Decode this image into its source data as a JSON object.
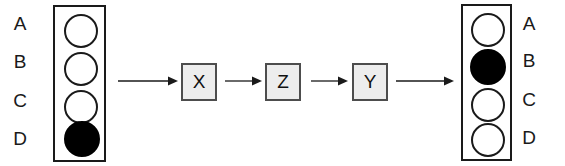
{
  "diagram": {
    "colors": {
      "stroke": "#1a1a1a",
      "filled": "#000000",
      "empty": "#ffffff",
      "box_fill": "#ededed",
      "box_border": "#4d4d4d",
      "background": "#ffffff"
    },
    "input_register": {
      "name": "input-register",
      "labels_side": "left",
      "rows": [
        {
          "label": "A",
          "state": "empty"
        },
        {
          "label": "B",
          "state": "empty"
        },
        {
          "label": "C",
          "state": "empty"
        },
        {
          "label": "D",
          "state": "filled"
        }
      ]
    },
    "output_register": {
      "name": "output-register",
      "labels_side": "right",
      "rows": [
        {
          "label": "A",
          "state": "empty"
        },
        {
          "label": "B",
          "state": "filled"
        },
        {
          "label": "C",
          "state": "empty"
        },
        {
          "label": "D",
          "state": "empty"
        }
      ]
    },
    "operations": [
      {
        "label": "X"
      },
      {
        "label": "Z"
      },
      {
        "label": "Y"
      }
    ],
    "arrows": [
      {
        "name": "arrow-input-to-x"
      },
      {
        "name": "arrow-x-to-z"
      },
      {
        "name": "arrow-z-to-y"
      },
      {
        "name": "arrow-y-to-output"
      }
    ]
  }
}
